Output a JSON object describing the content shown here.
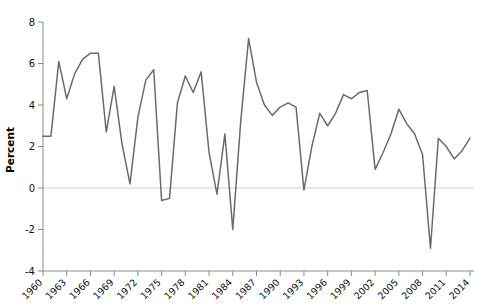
{
  "chart_data": {
    "type": "line",
    "title": "",
    "subtitle": "",
    "xlabel": "",
    "ylabel": "Percent",
    "xlim": [
      1960,
      2014
    ],
    "ylim": [
      -4,
      8
    ],
    "yticks": [
      -4,
      -2,
      0,
      2,
      4,
      6,
      8
    ],
    "ytick_labels": [
      "-4",
      "-2",
      "0",
      "2",
      "4",
      "6",
      "8"
    ],
    "xticks": [
      1960,
      1963,
      1966,
      1969,
      1972,
      1975,
      1978,
      1981,
      1984,
      1987,
      1990,
      1993,
      1996,
      1999,
      2002,
      2005,
      2008,
      2011,
      2014
    ],
    "xtick_labels": [
      "1960",
      "1963",
      "1966",
      "1969",
      "1972",
      "1975",
      "1978",
      "1981",
      "1984",
      "1987",
      "1990",
      "1993",
      "1996",
      "1999",
      "2002",
      "2005",
      "2008",
      "2011",
      "2014"
    ],
    "xtick_rotation": 45,
    "grid": false,
    "legend": false,
    "zero_line": true,
    "line_color": "#6b6b6b",
    "zero_line_color": "#cfcfcf",
    "axis_color": "#8a8a8a",
    "x": [
      1960,
      1961,
      1962,
      1963,
      1964,
      1965,
      1966,
      1967,
      1968,
      1969,
      1970,
      1971,
      1972,
      1973,
      1974,
      1975,
      1976,
      1977,
      1978,
      1979,
      1980,
      1981,
      1982,
      1983,
      1984,
      1985,
      1986,
      1987,
      1988,
      1989,
      1990,
      1991,
      1992,
      1993,
      1994,
      1995,
      1996,
      1997,
      1998,
      1999,
      2000,
      2001,
      2002,
      2003,
      2004,
      2005,
      2006,
      2007,
      2008,
      2009,
      2010,
      2011,
      2012,
      2013,
      2014
    ],
    "values": [
      2.5,
      2.5,
      6.1,
      4.3,
      5.5,
      6.2,
      6.5,
      6.5,
      2.7,
      4.9,
      2.1,
      0.2,
      3.4,
      5.2,
      5.7,
      -0.6,
      -0.5,
      4.1,
      5.4,
      4.6,
      5.6,
      1.7,
      -0.3,
      2.6,
      -2.0,
      3.2,
      7.2,
      5.1,
      4.0,
      3.5,
      3.9,
      4.1,
      3.9,
      -0.1,
      2.0,
      3.6,
      3.0,
      3.6,
      4.5,
      4.3,
      4.6,
      4.7,
      0.9,
      1.7,
      2.6,
      3.8,
      3.1,
      2.6,
      1.6,
      -2.9,
      2.4,
      2.0,
      1.4,
      1.8,
      2.4
    ]
  }
}
